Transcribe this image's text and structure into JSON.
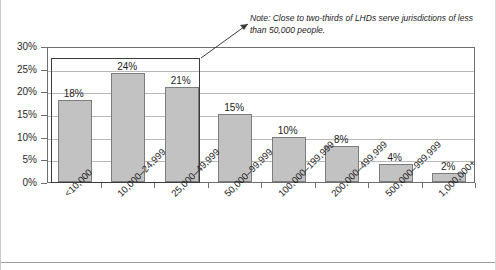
{
  "chart_data": {
    "type": "bar",
    "title": "",
    "subtitle": "",
    "xlabel": "",
    "ylabel": "",
    "categories": [
      "<10,000",
      "10,000–24,999",
      "25,000–49,999",
      "50,000–99,999",
      "100,000–199,999",
      "200,000–499,999",
      "500,000–999,999",
      "1,000,000+"
    ],
    "values": [
      18,
      24,
      21,
      15,
      10,
      8,
      4,
      2
    ],
    "value_labels": [
      "18%",
      "24%",
      "21%",
      "15%",
      "10%",
      "8%",
      "4%",
      "2%"
    ],
    "ylim": [
      0,
      30
    ],
    "ytick_values": [
      0,
      5,
      10,
      15,
      20,
      25,
      30
    ],
    "ytick_labels": [
      "0%",
      "5%",
      "10%",
      "15%",
      "20%",
      "25%",
      "30%"
    ],
    "grid": true,
    "legend": "none",
    "bar_fill_color": "#c2c2c2",
    "bar_border_color": "#7d7d7d",
    "gridline_color": "#b9b9b9",
    "axis_color": "#6e6e6e",
    "annotations": [
      {
        "name": "note-callout",
        "text": "Note: Close to two-thirds of LHDs serve jurisdictions of less than 50,000 people.",
        "highlights_categories": [
          "<10,000",
          "10,000–24,999",
          "25,000–49,999"
        ],
        "box_color": "#3c3c3c",
        "leader_color": "#3c3c3c"
      }
    ]
  }
}
